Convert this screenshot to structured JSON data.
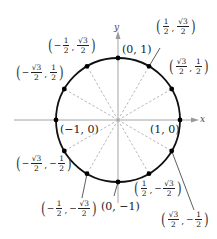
{
  "diagram": {
    "axes": {
      "x_label": "x",
      "y_label": "y"
    },
    "colors": {
      "circle": "#111111",
      "axes": "#9a9a9a",
      "radials": "#a0a0a0",
      "points": "#000000",
      "leaders": "#333333"
    },
    "points": [
      {
        "name": "point-0-1",
        "label": "(0, 1)"
      },
      {
        "name": "point-1-0",
        "label": "(1, 0)"
      },
      {
        "name": "point-neg1-0",
        "label": "(−1, 0)"
      },
      {
        "name": "point-0-neg1",
        "label": "(0, −1)"
      },
      {
        "name": "point-half-sqrt3half",
        "x": {
          "sign": "",
          "num": "1",
          "den": "2"
        },
        "y": {
          "sign": "",
          "num": "√3",
          "den": "2"
        }
      },
      {
        "name": "point-sqrt3half-half",
        "x": {
          "sign": "",
          "num": "√3",
          "den": "2"
        },
        "y": {
          "sign": "",
          "num": "1",
          "den": "2"
        }
      },
      {
        "name": "point-neghalf-sqrt3half",
        "x": {
          "sign": "−",
          "num": "1",
          "den": "2"
        },
        "y": {
          "sign": "",
          "num": "√3",
          "den": "2"
        }
      },
      {
        "name": "point-negsqrt3half-half",
        "x": {
          "sign": "−",
          "num": "√3",
          "den": "2"
        },
        "y": {
          "sign": "",
          "num": "1",
          "den": "2"
        }
      },
      {
        "name": "point-negsqrt3half-neghalf",
        "x": {
          "sign": "−",
          "num": "√3",
          "den": "2"
        },
        "y": {
          "sign": "−",
          "num": "1",
          "den": "2"
        }
      },
      {
        "name": "point-neghalf-negsqrt3half",
        "x": {
          "sign": "−",
          "num": "1",
          "den": "2"
        },
        "y": {
          "sign": "−",
          "num": "√3",
          "den": "2"
        }
      },
      {
        "name": "point-half-negsqrt3half",
        "x": {
          "sign": "",
          "num": "1",
          "den": "2"
        },
        "y": {
          "sign": "−",
          "num": "√3",
          "den": "2"
        }
      },
      {
        "name": "point-sqrt3half-neghalf",
        "x": {
          "sign": "",
          "num": "√3",
          "den": "2"
        },
        "y": {
          "sign": "−",
          "num": "1",
          "den": "2"
        }
      }
    ]
  }
}
